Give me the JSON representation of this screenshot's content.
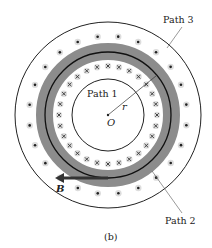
{
  "figure": {
    "caption": "(b)",
    "center_label": "O",
    "radius_label": "r",
    "field_label": "B",
    "paths": [
      {
        "label": "Path 1",
        "radius": 36
      },
      {
        "label": "Path 2",
        "radius": 63
      },
      {
        "label": "Path 3",
        "radius": 93
      }
    ],
    "band": {
      "inner_radius": 55,
      "outer_radius": 72,
      "color": "#8c8c8c"
    },
    "inner_current_ring": {
      "symbol": "cross",
      "radius": 49,
      "count": 28
    },
    "outer_current_ring": {
      "symbol": "dot",
      "radius": 79,
      "count": 24
    },
    "center": {
      "x": 108,
      "y": 115
    }
  }
}
